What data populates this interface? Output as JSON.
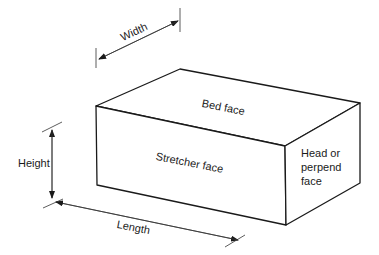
{
  "diagram": {
    "type": "brick-dimensions",
    "labels": {
      "width": "Width",
      "height": "Height",
      "length": "Length",
      "bed_face": "Bed face",
      "stretcher_face": "Stretcher face",
      "head_face_line1": "Head or",
      "head_face_line2": "perpend",
      "head_face_line3": "face"
    },
    "colors": {
      "stroke": "#1a1a1a",
      "dimension": "#333333",
      "background": "#ffffff"
    }
  }
}
